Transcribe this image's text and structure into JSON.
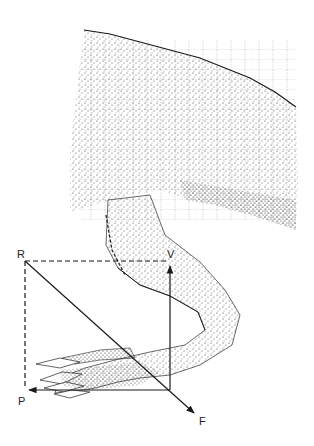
{
  "figure": {
    "style": "stippled pen-and-ink illustration",
    "colors": {
      "ink": "#1a1a1a",
      "background": "#ffffff",
      "stipple": "#3a3a3a"
    }
  },
  "vectors": {
    "R": {
      "label": "R",
      "kind": "resultant corner (dashed)"
    },
    "V": {
      "label": "V",
      "kind": "vertical component arrow (up)"
    },
    "P": {
      "label": "P",
      "kind": "horizontal component arrow (left)"
    },
    "F": {
      "label": "F",
      "kind": "diagonal force arrow (down-right)"
    }
  }
}
